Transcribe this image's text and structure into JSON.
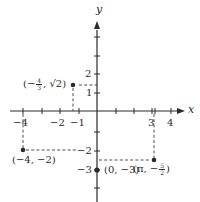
{
  "diagram": {
    "type": "coordinate-plane",
    "axes": {
      "x_label": "x",
      "y_label": "y",
      "x_ticks": [
        -4,
        -3,
        -2,
        -1,
        1,
        2,
        3,
        4
      ],
      "y_ticks": [
        4,
        3,
        2,
        1,
        -1,
        -2,
        -3,
        -4
      ],
      "x_tick_labels": {
        "neg4": "−4",
        "neg2": "−2",
        "neg1": "−1",
        "pos3": "3",
        "pos4": "4"
      },
      "y_tick_labels": {
        "pos2": "2",
        "pos1": "1",
        "neg2": "−2",
        "neg3": "−3"
      }
    },
    "points": [
      {
        "id": "p1",
        "label_prefix": "(−",
        "frac_num": "4",
        "frac_den": "3",
        "label_suffix": ", √2)",
        "coords": "(-4/3, √2)"
      },
      {
        "id": "p2",
        "label": "(−4, −2)",
        "coords": "(-4, -2)"
      },
      {
        "id": "p3",
        "label": "(0, −3)",
        "coords": "(0, -3)"
      },
      {
        "id": "p4",
        "label_prefix": "(π, −",
        "frac_num": "5",
        "frac_den": "2",
        "label_suffix": ")",
        "coords": "(π, -5/2)"
      }
    ],
    "pi_marker": "π"
  }
}
